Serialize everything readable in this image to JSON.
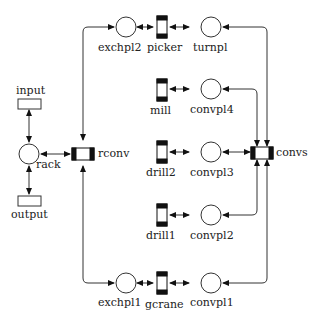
{
  "diagram": {
    "type": "petri-net",
    "places": [
      {
        "id": "exchpl2",
        "label": "exchpl2"
      },
      {
        "id": "turnpl",
        "label": "turnpl"
      },
      {
        "id": "convpl4",
        "label": "convpl4"
      },
      {
        "id": "convpl3",
        "label": "convpl3"
      },
      {
        "id": "convpl2",
        "label": "convpl2"
      },
      {
        "id": "convpl1",
        "label": "convpl1"
      },
      {
        "id": "exchpl1",
        "label": "exchpl1"
      },
      {
        "id": "rack",
        "label": "rack"
      }
    ],
    "transitions": [
      {
        "id": "picker",
        "label": "picker"
      },
      {
        "id": "mill",
        "label": "mill"
      },
      {
        "id": "drill2",
        "label": "drill2"
      },
      {
        "id": "drill1",
        "label": "drill1"
      },
      {
        "id": "gcrane",
        "label": "gcrane"
      },
      {
        "id": "rconv",
        "label": "rconv"
      },
      {
        "id": "convs",
        "label": "convs"
      }
    ],
    "ports": [
      {
        "id": "input",
        "label": "input"
      },
      {
        "id": "output",
        "label": "output"
      }
    ],
    "arcs": [
      [
        "exchpl2",
        "picker"
      ],
      [
        "picker",
        "turnpl"
      ],
      [
        "turnpl",
        "convs"
      ],
      [
        "mill",
        "convpl4"
      ],
      [
        "convpl4",
        "convs"
      ],
      [
        "drill2",
        "convpl3"
      ],
      [
        "convpl3",
        "convs"
      ],
      [
        "drill1",
        "convpl2"
      ],
      [
        "convpl2",
        "convs"
      ],
      [
        "exchpl1",
        "gcrane"
      ],
      [
        "gcrane",
        "convpl1"
      ],
      [
        "convpl1",
        "convs"
      ],
      [
        "rconv",
        "exchpl2"
      ],
      [
        "rconv",
        "exchpl1"
      ],
      [
        "rack",
        "rconv"
      ],
      [
        "input",
        "rack"
      ],
      [
        "rack",
        "output"
      ]
    ]
  }
}
